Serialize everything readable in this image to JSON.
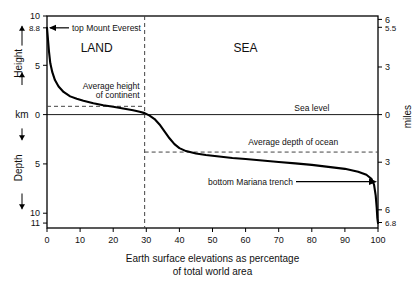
{
  "chart_data": {
    "type": "line",
    "title": "",
    "caption_line1": "Earth surface elevations as percentage",
    "caption_line2": "of total world area",
    "xlabel": "Earth surface elevations as percentage of total world area",
    "ylabel_left_upper": "Height",
    "ylabel_left_unit": "km",
    "ylabel_left_lower": "Depth",
    "ylabel_right": "miles",
    "xlim": [
      0,
      100
    ],
    "xticks": [
      0,
      10,
      20,
      30,
      40,
      50,
      60,
      70,
      80,
      90,
      100
    ],
    "xticklabels": [
      "0",
      "10",
      "20",
      "30",
      "40",
      "50",
      "60",
      "70",
      "80",
      "90",
      "100"
    ],
    "ylim_km": [
      -11.5,
      10
    ],
    "yticks_left_km": [
      10,
      8.8,
      5,
      0,
      -5,
      -10,
      -11
    ],
    "yticklabels_left": [
      "10",
      "8.8",
      "5",
      "0",
      "5",
      "10",
      "11"
    ],
    "yticks_right_miles": [
      6,
      5.5,
      3,
      0,
      -3,
      -6,
      -6.8
    ],
    "yticklabels_right": [
      "6",
      "5.5",
      "3",
      "0",
      "3",
      "6",
      "6.8"
    ],
    "grid": false,
    "legend": "none",
    "series": [
      {
        "name": "hypsographic curve",
        "x": [
          0.0,
          0.3,
          0.6,
          1.0,
          1.6,
          2.4,
          3.5,
          5.0,
          7.0,
          9.0,
          11.0,
          14.0,
          17.0,
          20.0,
          23.0,
          26.0,
          28.0,
          29.5,
          31.0,
          32.5,
          34.0,
          35.5,
          37.0,
          38.5,
          40.0,
          42.0,
          45.0,
          48.0,
          52.0,
          56.0,
          60.0,
          65.0,
          70.0,
          75.0,
          80.0,
          85.0,
          90.0,
          94.0,
          96.5,
          98.0,
          98.8,
          99.3,
          99.6,
          99.8,
          100.0
        ],
        "y_km": [
          8.8,
          7.6,
          6.4,
          5.2,
          4.3,
          3.5,
          2.85,
          2.3,
          1.85,
          1.6,
          1.4,
          1.15,
          0.95,
          0.8,
          0.62,
          0.45,
          0.3,
          0.15,
          -0.1,
          -0.45,
          -1.0,
          -1.7,
          -2.4,
          -3.0,
          -3.4,
          -3.7,
          -3.95,
          -4.1,
          -4.25,
          -4.4,
          -4.5,
          -4.65,
          -4.8,
          -4.95,
          -5.1,
          -5.3,
          -5.5,
          -5.8,
          -6.1,
          -6.5,
          -7.1,
          -8.2,
          -9.4,
          -10.5,
          -11.0
        ]
      }
    ],
    "annotations": [
      {
        "name": "top-mount-everest",
        "text": "top Mount Everest",
        "x": 0,
        "y_km": 8.8,
        "arrow": "left"
      },
      {
        "name": "bottom-mariana-trench",
        "text": "bottom Mariana trench",
        "x": 100,
        "y_km": -6.8,
        "arrow": "right"
      },
      {
        "name": "land-region",
        "text": "LAND",
        "x": 15,
        "y_km": 6.3
      },
      {
        "name": "sea-region",
        "text": "SEA",
        "x": 60,
        "y_km": 6.3
      },
      {
        "name": "sea-level-label",
        "text": "Sea level",
        "x": 80,
        "y_km": 0.35
      },
      {
        "name": "average-height-of-continent",
        "text_line1": "Average height",
        "text_line2": "of continent",
        "value_km": 0.84
      },
      {
        "name": "average-depth-of-ocean",
        "text": "Average depth of ocean",
        "value_km": -3.8
      }
    ],
    "reference_lines": [
      {
        "name": "sea-level-line",
        "orientation": "horizontal",
        "y_km": 0,
        "style": "solid",
        "extent": "full"
      },
      {
        "name": "land-sea-divider",
        "orientation": "vertical",
        "x": 29.5,
        "style": "dashed",
        "extent": "full"
      },
      {
        "name": "avg-continent-height-line",
        "orientation": "horizontal",
        "y_km": 0.84,
        "style": "dashed",
        "x_from": 0,
        "x_to": 29.5
      },
      {
        "name": "avg-ocean-depth-line",
        "orientation": "horizontal",
        "y_km": -3.8,
        "style": "dashed",
        "x_from": 29.5,
        "x_to": 100
      }
    ],
    "colors": {
      "axis": "#000000",
      "curve": "#000000",
      "dashed": "#444444",
      "background": "#ffffff"
    }
  }
}
